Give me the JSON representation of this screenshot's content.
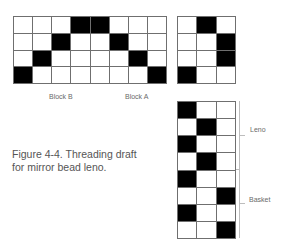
{
  "figure": {
    "caption_line1": "Figure 4-4. Threading draft",
    "caption_line2": "for mirror bead leno."
  },
  "threading_grid": {
    "cols": 8,
    "rows": 4,
    "cells": [
      [
        0,
        0,
        0,
        1,
        1,
        0,
        0,
        0
      ],
      [
        0,
        0,
        1,
        0,
        0,
        1,
        0,
        0
      ],
      [
        0,
        1,
        0,
        0,
        0,
        0,
        1,
        0
      ],
      [
        1,
        0,
        0,
        0,
        0,
        0,
        0,
        1
      ]
    ],
    "labels": {
      "block_b": "Block B",
      "block_a": "Block A"
    }
  },
  "tieup_grid": {
    "cols": 3,
    "rows": 4,
    "cells": [
      [
        0,
        1,
        0
      ],
      [
        0,
        0,
        1
      ],
      [
        0,
        0,
        1
      ],
      [
        1,
        0,
        0
      ]
    ]
  },
  "treadling_grid": {
    "cols": 3,
    "rows": 8,
    "cells": [
      [
        1,
        0,
        0
      ],
      [
        0,
        1,
        0
      ],
      [
        1,
        0,
        0
      ],
      [
        0,
        1,
        0
      ],
      [
        1,
        0,
        0
      ],
      [
        0,
        0,
        1
      ],
      [
        1,
        0,
        0
      ],
      [
        0,
        0,
        1
      ]
    ],
    "labels": {
      "leno": "Leno",
      "basket": "Basket"
    }
  },
  "colors": {
    "filled": "#000000",
    "empty": "#ffffff",
    "gridline": "#6f6f6f",
    "text": "#555555"
  }
}
